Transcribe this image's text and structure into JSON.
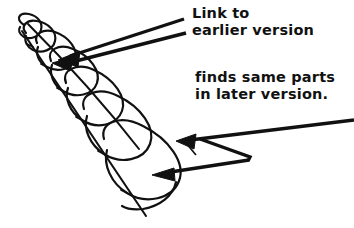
{
  "figure": {
    "background_color": "#ffffff",
    "ink_color": "#111111",
    "annotations": [
      {
        "name": "link-to-earlier-version",
        "lines": [
          "Link to",
          "earlier version"
        ],
        "line1": "Link to",
        "line2": "earlier version",
        "points_to": "upper coil of helix"
      },
      {
        "name": "finds-same-parts",
        "lines": [
          "finds same parts",
          "in later version."
        ],
        "line1": "finds same parts",
        "line2": "in later version.",
        "points_to": "lower coils of helix"
      }
    ],
    "pointers": [
      {
        "name": "upper-pointer",
        "style": "double-line wedge with solid arrowhead",
        "from": [
          185,
          20
        ],
        "to": [
          62,
          60
        ]
      },
      {
        "name": "lower-pointer-upper-arm",
        "style": "bent thick line with solid arrowhead",
        "from": [
          354,
          122
        ],
        "to": [
          181,
          141
        ]
      },
      {
        "name": "lower-pointer-lower-arm",
        "style": "thick line with solid arrowhead",
        "from": [
          248,
          159
        ],
        "to": [
          156,
          174
        ]
      }
    ],
    "helix": {
      "description": "conical spiral drawn freehand, widening from upper-left to lower-right",
      "turns": 7,
      "spine_from": [
        22,
        30
      ],
      "spine_to": [
        146,
        216
      ]
    }
  }
}
